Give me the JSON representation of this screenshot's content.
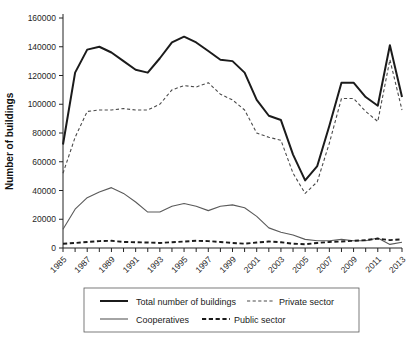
{
  "chart_data": {
    "type": "line",
    "title": "",
    "xlabel": "",
    "ylabel": "Number of buildings",
    "ylim": [
      0,
      160000
    ],
    "ytick_values": [
      0,
      20000,
      40000,
      60000,
      80000,
      100000,
      120000,
      140000,
      160000
    ],
    "ytick_labels": [
      "0",
      "20000",
      "40000",
      "60000",
      "80000",
      "100000",
      "120000",
      "140000",
      "160000"
    ],
    "grid": false,
    "legend_position": "bottom",
    "x": [
      1985,
      1986,
      1987,
      1988,
      1989,
      1990,
      1991,
      1992,
      1993,
      1994,
      1995,
      1996,
      1997,
      1998,
      1999,
      2000,
      2001,
      2002,
      2003,
      2004,
      2005,
      2006,
      2007,
      2008,
      2009,
      2010,
      2011,
      2012,
      2013
    ],
    "xtick_labels": [
      "1985",
      "1987",
      "1989",
      "1991",
      "1993",
      "1995",
      "1997",
      "1999",
      "2001",
      "2003",
      "2005",
      "2007",
      "2009",
      "2011",
      "2013"
    ],
    "xtick_values": [
      1985,
      1987,
      1989,
      1991,
      1993,
      1995,
      1997,
      1999,
      2001,
      2003,
      2005,
      2007,
      2009,
      2011,
      2013
    ],
    "series": [
      {
        "name": "Total number of buildings",
        "style": "thick-solid",
        "color": "#1b1b1b",
        "values": [
          72000,
          122000,
          138000,
          140000,
          136000,
          130000,
          124000,
          122000,
          132000,
          143000,
          147000,
          143000,
          137000,
          131000,
          130000,
          122000,
          103000,
          92000,
          89000,
          65000,
          47000,
          57000,
          85000,
          115000,
          115000,
          105000,
          99000,
          141000,
          105000
        ]
      },
      {
        "name": "Private sector",
        "style": "thin-dotted",
        "color": "#4a4a4a",
        "values": [
          52000,
          77000,
          95000,
          96000,
          96000,
          97000,
          96000,
          96000,
          100000,
          110000,
          113000,
          112000,
          115000,
          107000,
          103000,
          96000,
          80000,
          77000,
          75000,
          52000,
          38000,
          46000,
          73000,
          104000,
          104000,
          95000,
          88000,
          131000,
          96000
        ]
      },
      {
        "name": "Cooperatives",
        "style": "thin-solid",
        "color": "#5a5a5a",
        "values": [
          13000,
          27000,
          35000,
          39000,
          42000,
          38000,
          32000,
          25000,
          25000,
          29000,
          31000,
          29000,
          26000,
          29000,
          30000,
          28000,
          22000,
          14000,
          11000,
          9000,
          6000,
          5000,
          5000,
          6000,
          5000,
          5000,
          7000,
          2500,
          4000
        ]
      },
      {
        "name": "Public sector",
        "style": "thick-dashed",
        "color": "#1b1b1b",
        "values": [
          3000,
          3500,
          4200,
          4800,
          5000,
          4200,
          4000,
          3800,
          3500,
          4000,
          4500,
          5000,
          4800,
          4200,
          3500,
          3000,
          3800,
          4500,
          4000,
          3000,
          2600,
          3500,
          4200,
          4500,
          5000,
          5500,
          6500,
          5500,
          6000
        ]
      }
    ]
  },
  "axis": {
    "ylabel": "Number of buildings"
  },
  "legend": {
    "entries": [
      {
        "label": "Total number of buildings",
        "style": "thick-solid"
      },
      {
        "label": "Private sector",
        "style": "thin-dotted"
      },
      {
        "label": "Cooperatives",
        "style": "thin-solid"
      },
      {
        "label": "Public sector",
        "style": "thick-dashed"
      }
    ]
  }
}
